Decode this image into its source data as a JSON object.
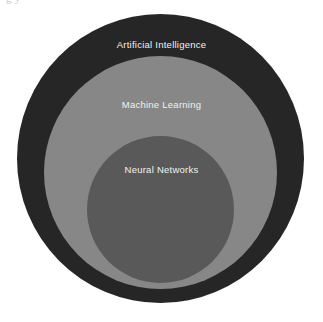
{
  "diagram": {
    "type": "nested-circles",
    "background_color": "#ffffff",
    "clipped_header_text": "g y",
    "rings": [
      {
        "id": "artificial-intelligence",
        "label": "Artificial Intelligence",
        "level": 1,
        "fill_color": "#262626",
        "text_color": "#f2f2f2"
      },
      {
        "id": "machine-learning",
        "label": "Machine Learning",
        "level": 2,
        "fill_color": "#878787",
        "text_color": "#f2f2f2"
      },
      {
        "id": "neural-networks",
        "label": "Neural Networks",
        "level": 3,
        "fill_color": "#595959",
        "text_color": "#f2f2f2"
      }
    ]
  }
}
